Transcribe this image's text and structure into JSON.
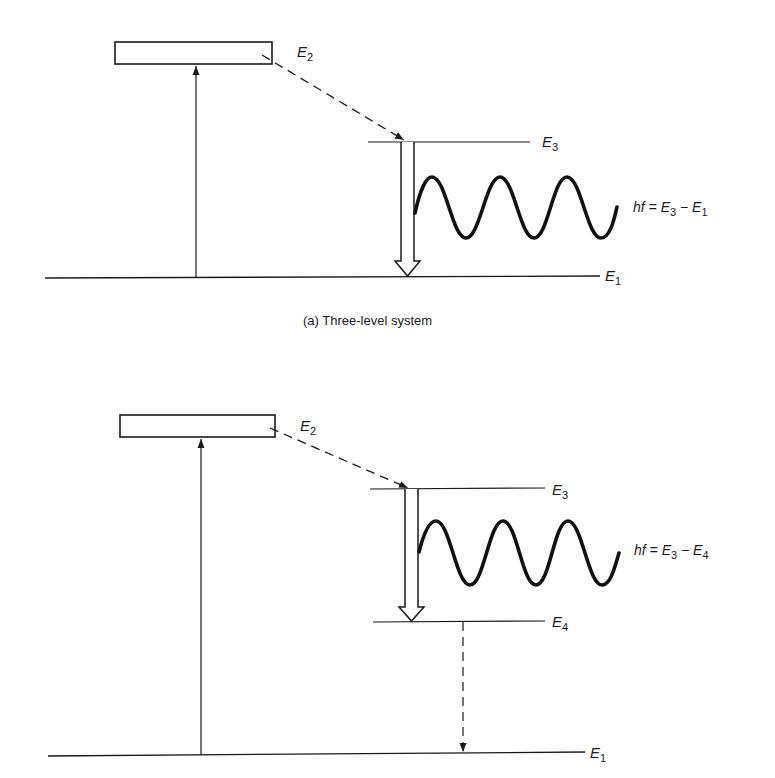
{
  "diagram_a": {
    "caption": "(a)  Three-level system",
    "levels": {
      "e2": {
        "sym": "E",
        "sub": "2"
      },
      "e3": {
        "sym": "E",
        "sub": "3"
      },
      "e1": {
        "sym": "E",
        "sub": "1"
      }
    },
    "equation": {
      "lhs": "hf = ",
      "a": "E",
      "a_sub": "3",
      "op": " − ",
      "b": "E",
      "b_sub": "1"
    }
  },
  "diagram_b": {
    "levels": {
      "e2": {
        "sym": "E",
        "sub": "2"
      },
      "e3": {
        "sym": "E",
        "sub": "3"
      },
      "e4": {
        "sym": "E",
        "sub": "4"
      },
      "e1": {
        "sym": "E",
        "sub": "1"
      }
    },
    "equation": {
      "lhs": "hf = ",
      "a": "E",
      "a_sub": "3",
      "op": " − ",
      "b": "E",
      "b_sub": "4"
    }
  },
  "colors": {
    "ink": "#1a1a1a",
    "background": "#ffffff"
  }
}
